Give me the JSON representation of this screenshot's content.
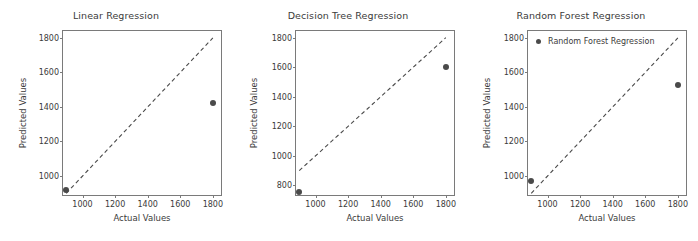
{
  "figure": {
    "width": 698,
    "height": 241,
    "background": "#ffffff",
    "marker_color": "#4a4a4a",
    "line_color": "#4a4a4a",
    "axis_color": "#7a7a7a",
    "text_color": "#3b3b3b"
  },
  "chart_data": [
    {
      "type": "scatter",
      "title": "Linear Regression",
      "xlabel": "Actual Values",
      "ylabel": "Predicted Values",
      "xlim": [
        880,
        1850
      ],
      "ylim": [
        890,
        1840
      ],
      "xticks": [
        1000,
        1200,
        1400,
        1600,
        1800
      ],
      "xtick_labels": [
        "1000",
        "1200",
        "1400",
        "1600",
        "1800"
      ],
      "yticks": [
        1000,
        1200,
        1400,
        1600,
        1800
      ],
      "ytick_labels": [
        "1000",
        "1200",
        "1400",
        "1600",
        "1800"
      ],
      "grid": false,
      "legend": null,
      "series": [
        {
          "name": "Linear Regression",
          "kind": "scatter",
          "points": [
            {
              "x": 900,
              "y": 920
            },
            {
              "x": 1800,
              "y": 1422
            }
          ]
        },
        {
          "name": "ideal-fit",
          "kind": "dashed-line",
          "points": [
            {
              "x": 900,
              "y": 900
            },
            {
              "x": 1800,
              "y": 1800
            }
          ]
        }
      ]
    },
    {
      "type": "scatter",
      "title": "Decision Tree Regression",
      "xlabel": "Actual Values",
      "ylabel": "Predicted Values",
      "xlim": [
        880,
        1850
      ],
      "ylim": [
        735,
        1845
      ],
      "xticks": [
        1000,
        1200,
        1400,
        1600,
        1800
      ],
      "xtick_labels": [
        "1000",
        "1200",
        "1400",
        "1600",
        "1800"
      ],
      "yticks": [
        800,
        1000,
        1200,
        1400,
        1600,
        1800
      ],
      "ytick_labels": [
        "800",
        "1000",
        "1200",
        "1400",
        "1600",
        "1800"
      ],
      "grid": false,
      "legend": null,
      "series": [
        {
          "name": "Decision Tree Regression",
          "kind": "scatter",
          "points": [
            {
              "x": 900,
              "y": 755
            },
            {
              "x": 1800,
              "y": 1600
            }
          ]
        },
        {
          "name": "ideal-fit",
          "kind": "dashed-line",
          "points": [
            {
              "x": 900,
              "y": 900
            },
            {
              "x": 1800,
              "y": 1800
            }
          ]
        }
      ]
    },
    {
      "type": "scatter",
      "title": "Random Forest Regression",
      "xlabel": "Actual Values",
      "ylabel": "Predicted Values",
      "xlim": [
        880,
        1850
      ],
      "ylim": [
        890,
        1840
      ],
      "xticks": [
        1000,
        1200,
        1400,
        1600,
        1800
      ],
      "xtick_labels": [
        "1000",
        "1200",
        "1400",
        "1600",
        "1800"
      ],
      "yticks": [
        1000,
        1200,
        1400,
        1600,
        1800
      ],
      "ytick_labels": [
        "1000",
        "1200",
        "1400",
        "1600",
        "1800"
      ],
      "grid": false,
      "legend": {
        "label": "Random Forest Regression",
        "position": "upper left"
      },
      "series": [
        {
          "name": "Random Forest Regression",
          "kind": "scatter",
          "points": [
            {
              "x": 900,
              "y": 970
            },
            {
              "x": 1800,
              "y": 1525
            }
          ]
        },
        {
          "name": "ideal-fit",
          "kind": "dashed-line",
          "points": [
            {
              "x": 900,
              "y": 900
            },
            {
              "x": 1800,
              "y": 1800
            }
          ]
        }
      ]
    }
  ]
}
